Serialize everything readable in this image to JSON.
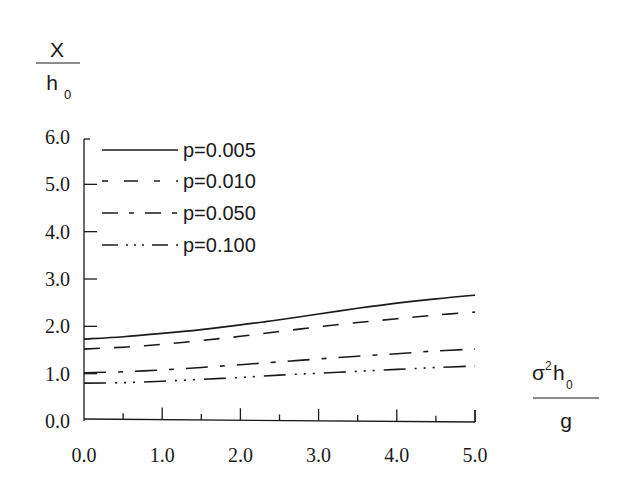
{
  "chart_data": {
    "type": "line",
    "title": "",
    "ylabel": {
      "numerator": "X",
      "denominator": "h",
      "denominator_sub": "0"
    },
    "xlabel": {
      "numerator_sigma": "σ",
      "numerator_sup": "2",
      "numerator_h": "h",
      "numerator_sub": "0",
      "denominator": "g"
    },
    "xlim": [
      0,
      5
    ],
    "ylim": [
      0,
      6
    ],
    "x_ticks": [
      "0.0",
      "1.0",
      "2.0",
      "3.0",
      "4.0",
      "5.0"
    ],
    "y_ticks": [
      "0.0",
      "1.0",
      "2.0",
      "3.0",
      "4.0",
      "5.0",
      "6.0"
    ],
    "grid": false,
    "legend_position": "upper-left",
    "x": [
      0.0,
      0.5,
      1.0,
      1.5,
      2.0,
      2.5,
      3.0,
      3.5,
      4.0,
      4.5,
      5.0
    ],
    "series": [
      {
        "name": "p=0.005",
        "style": "solid",
        "values": [
          1.73,
          1.78,
          1.85,
          1.93,
          2.03,
          2.14,
          2.26,
          2.38,
          2.49,
          2.58,
          2.66
        ]
      },
      {
        "name": "p=0.010",
        "style": "dashed",
        "values": [
          1.52,
          1.56,
          1.62,
          1.7,
          1.79,
          1.89,
          1.99,
          2.08,
          2.16,
          2.24,
          2.3
        ]
      },
      {
        "name": "p=0.050",
        "style": "dash-dot",
        "values": [
          1.02,
          1.04,
          1.08,
          1.13,
          1.19,
          1.25,
          1.31,
          1.37,
          1.42,
          1.48,
          1.52
        ]
      },
      {
        "name": "p=0.100",
        "style": "dash-dot-dot",
        "values": [
          0.8,
          0.81,
          0.84,
          0.88,
          0.92,
          0.97,
          1.01,
          1.05,
          1.09,
          1.13,
          1.16
        ]
      }
    ]
  },
  "colors": {
    "line": "#1a1a1a",
    "background": "#ffffff"
  }
}
